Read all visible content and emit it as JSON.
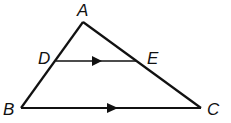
{
  "diagram": {
    "type": "triangle",
    "points": {
      "A": {
        "label": "A",
        "x": 83,
        "y": 22
      },
      "B": {
        "label": "B",
        "x": 21,
        "y": 108
      },
      "C": {
        "label": "C",
        "x": 201,
        "y": 108
      },
      "D": {
        "label": "D",
        "x": 56,
        "y": 61
      },
      "E": {
        "label": "E",
        "x": 136,
        "y": 61
      }
    },
    "segments": [
      "AB",
      "AC",
      "BC",
      "DE"
    ],
    "parallel_marks": [
      "DE",
      "BC"
    ],
    "stroke_color": "#111111"
  }
}
